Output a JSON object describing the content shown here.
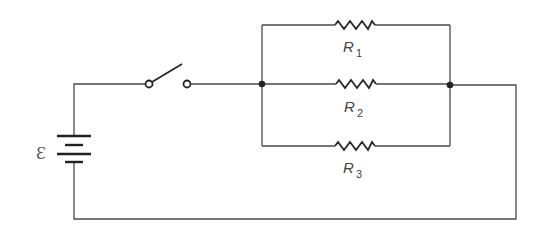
{
  "diagram": {
    "type": "circuit-schematic",
    "source": {
      "symbol": "Ɛ",
      "label": "emf"
    },
    "switch": {
      "state": "open"
    },
    "resistors": [
      {
        "id": "R1",
        "letter": "R",
        "subscript": "1",
        "branch": "top"
      },
      {
        "id": "R2",
        "letter": "R",
        "subscript": "2",
        "branch": "middle"
      },
      {
        "id": "R3",
        "letter": "R",
        "subscript": "3",
        "branch": "bottom"
      }
    ],
    "junctions": 2,
    "colors": {
      "wire": "#4a4a4a",
      "component": "#222222",
      "label": "#444444",
      "background": "#ffffff"
    }
  }
}
